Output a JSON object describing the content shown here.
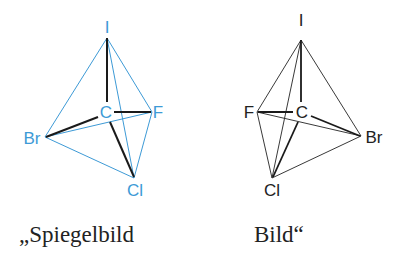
{
  "colors": {
    "mirror_edges": "#3d9ad6",
    "mirror_labels": "#3d9ad6",
    "bonds": "#1a1a1a",
    "image_edges": "#222222"
  },
  "mirror_molecule": {
    "caption": "„Spiegelbild",
    "atoms": {
      "top": "I",
      "center": "C",
      "right": "F",
      "left": "Br",
      "bottom": "Cl"
    }
  },
  "image_molecule": {
    "caption": "Bild“",
    "atoms": {
      "top": "I",
      "center": "C",
      "left": "F",
      "right": "Br",
      "bottom": "Cl"
    }
  }
}
